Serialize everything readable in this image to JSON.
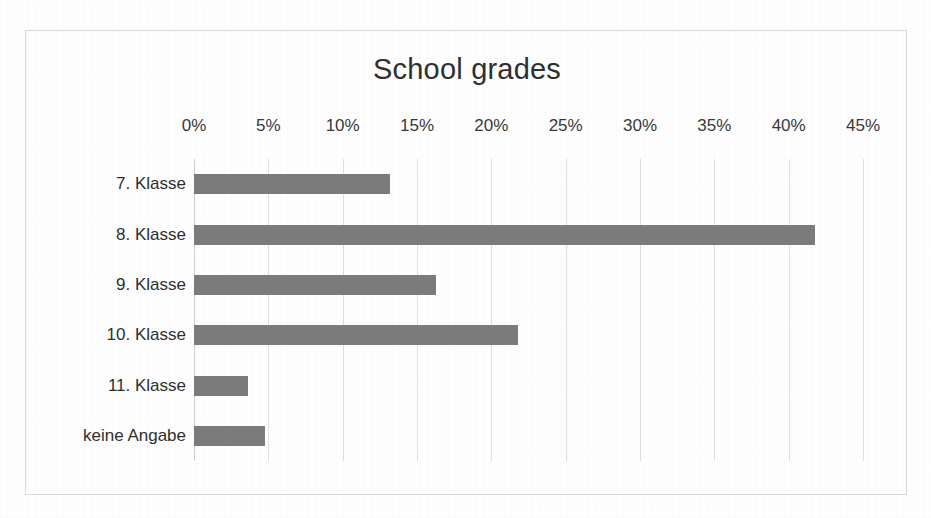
{
  "chart_data": {
    "type": "bar",
    "orientation": "horizontal",
    "title": "School grades",
    "xlabel": "",
    "ylabel": "",
    "categories": [
      "7. Klasse",
      "8. Klasse",
      "9. Klasse",
      "10. Klasse",
      "11. Klasse",
      "keine Angabe"
    ],
    "values": [
      13.2,
      41.8,
      16.3,
      21.8,
      3.6,
      4.8
    ],
    "value_unit": "%",
    "xlim": [
      0,
      45
    ],
    "xticks": [
      0,
      5,
      10,
      15,
      20,
      25,
      30,
      35,
      40,
      45
    ],
    "xtick_labels": [
      "0%",
      "5%",
      "10%",
      "15%",
      "20%",
      "25%",
      "30%",
      "35%",
      "40%",
      "45%"
    ],
    "grid": true,
    "grid_axis": "x",
    "legend": false,
    "series": [
      {
        "name": "School grades",
        "color": "#7b7b7b",
        "values": [
          13.2,
          41.8,
          16.3,
          21.8,
          3.6,
          4.8
        ]
      }
    ]
  },
  "style": {
    "bar_color": "#7b7b7b",
    "gridline_color": "#dedede",
    "axis_color": "#cfcfcf",
    "frame_border_color": "#d9d9d9",
    "title_color": "#2f2f2f",
    "label_color": "#2e2e2e",
    "background": "#ffffff"
  }
}
